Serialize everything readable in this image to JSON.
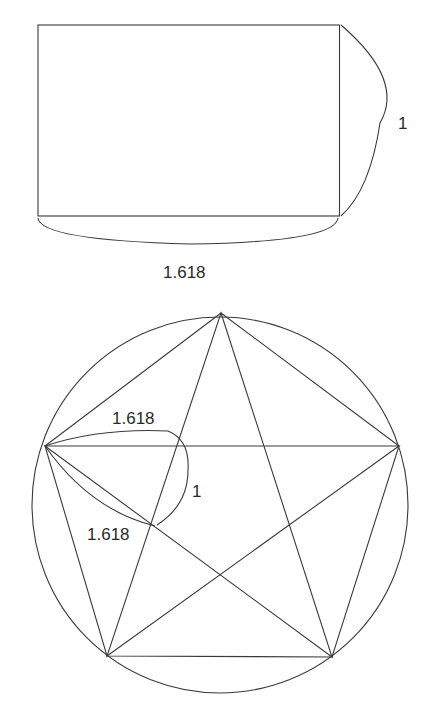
{
  "diagram": {
    "golden_rectangle": {
      "width_label": "1.618",
      "height_label": "1"
    },
    "pentagram": {
      "upper_segment_label": "1.618",
      "inner_segment_label": "1",
      "lower_segment_label": "1.618"
    },
    "colors": {
      "line": "#3a3a3a",
      "text": "#2a2a2a",
      "background": "#ffffff"
    }
  }
}
